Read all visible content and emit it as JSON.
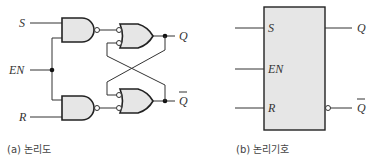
{
  "logic_diagram": {
    "inputs": {
      "s": "S",
      "en": "EN",
      "r": "R"
    },
    "outputs": {
      "q": "Q",
      "q_bar": "Q"
    },
    "caption": "(a) 논리도"
  },
  "logic_symbol": {
    "inputs": {
      "s": "S",
      "en": "EN",
      "r": "R"
    },
    "outputs": {
      "q": "Q",
      "q_bar": "Q"
    },
    "caption": "(b) 논리기호"
  },
  "colors": {
    "gate_fill": "#e6e6e6",
    "line": "#222222",
    "background": "#ffffff"
  }
}
